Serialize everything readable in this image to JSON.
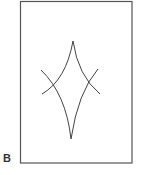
{
  "figure": {
    "panel_label": "B",
    "frame": {
      "x": 20,
      "y": 1,
      "width": 112,
      "height": 162
    },
    "stroke_color": "#444444",
    "frame_color": "#555555",
    "shape": "diamond-like curvilinear figure formed by two intersecting arc pairs",
    "top_cusp": [
      73,
      41
    ],
    "bottom_cusp": [
      71,
      139
    ],
    "left_crossing": [
      51,
      89
    ],
    "right_crossing": [
      89,
      82
    ]
  }
}
